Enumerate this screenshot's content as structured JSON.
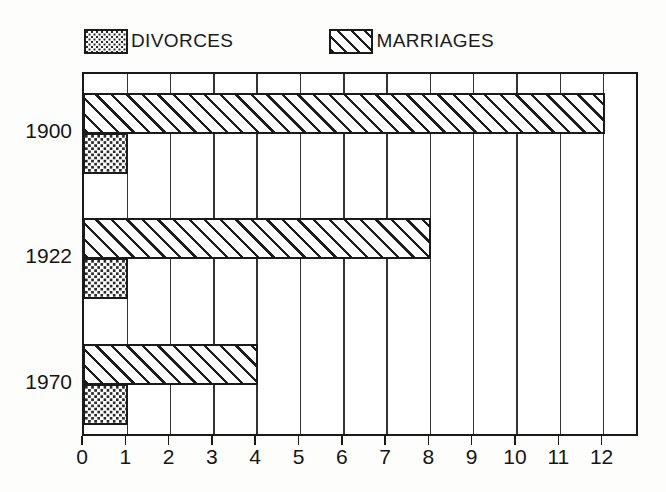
{
  "legend": {
    "entries": [
      {
        "label": "DIVORCES",
        "pattern": "dots-swatch-icon",
        "color": "#2a2a2a"
      },
      {
        "label": "MARRIAGES",
        "pattern": "diagonal-hatch-swatch-icon",
        "color": "#1c1c1c"
      }
    ]
  },
  "axes": {
    "x_ticks": [
      "0",
      "1",
      "2",
      "3",
      "4",
      "5",
      "6",
      "7",
      "8",
      "9",
      "10",
      "11",
      "12"
    ],
    "y_ticks": [
      "1900",
      "1922",
      "1970"
    ]
  },
  "chart_data": {
    "type": "bar",
    "orientation": "horizontal",
    "title": "",
    "subtitle": "",
    "xlabel": "",
    "ylabel": "",
    "categories": [
      "1900",
      "1922",
      "1970"
    ],
    "series": [
      {
        "name": "MARRIAGES",
        "values": [
          12,
          8,
          4
        ]
      },
      {
        "name": "DIVORCES",
        "values": [
          1,
          1,
          1
        ]
      }
    ],
    "xlim": [
      0,
      13
    ],
    "xtick_values": [
      0,
      1,
      2,
      3,
      4,
      5,
      6,
      7,
      8,
      9,
      10,
      11,
      12
    ],
    "grid": true,
    "grid_axis": "x",
    "legend_position": "above-plot"
  }
}
